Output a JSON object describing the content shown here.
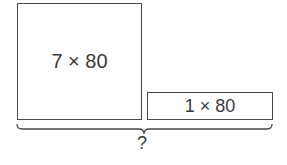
{
  "diagram": {
    "big_box": {
      "label": "7 × 80"
    },
    "small_box": {
      "label": "1 × 80"
    },
    "brace": {
      "label": "?"
    }
  }
}
